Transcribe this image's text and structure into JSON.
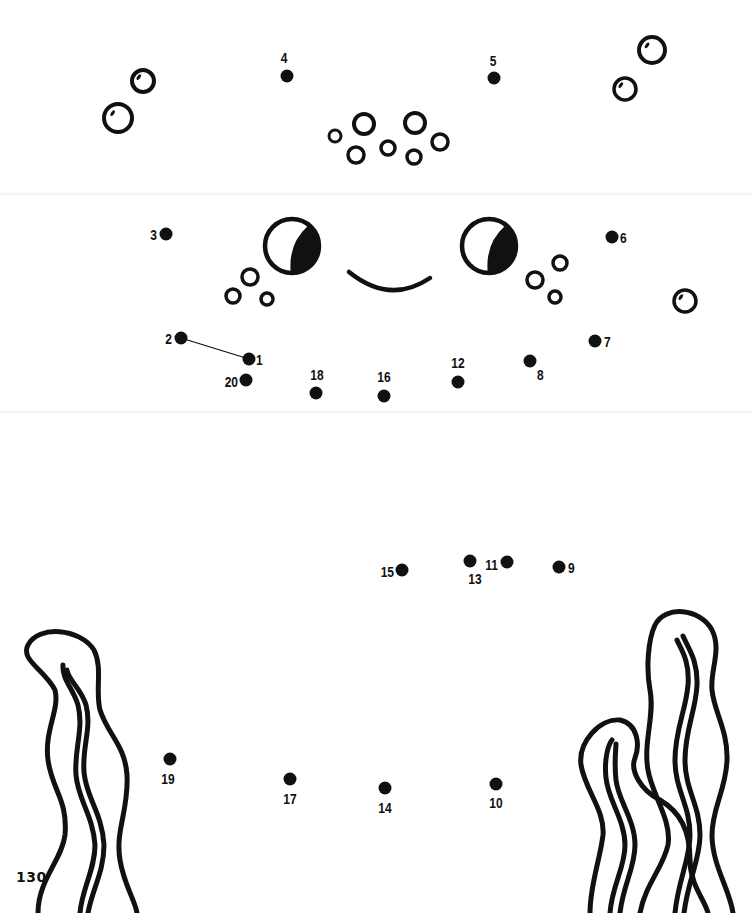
{
  "page": {
    "page_number": "130",
    "background": "#ffffff",
    "ink": "#111111"
  },
  "dots": [
    {
      "n": "1",
      "x": 249,
      "y": 359,
      "lx": 256,
      "ly": 365,
      "anchor": "start"
    },
    {
      "n": "2",
      "x": 181,
      "y": 338,
      "lx": 172,
      "ly": 344,
      "anchor": "end"
    },
    {
      "n": "3",
      "x": 166,
      "y": 234,
      "lx": 157,
      "ly": 240,
      "anchor": "end"
    },
    {
      "n": "4",
      "x": 287,
      "y": 76,
      "lx": 284,
      "ly": 63,
      "anchor": "middle"
    },
    {
      "n": "5",
      "x": 494,
      "y": 78,
      "lx": 493,
      "ly": 66,
      "anchor": "middle"
    },
    {
      "n": "6",
      "x": 612,
      "y": 237,
      "lx": 620,
      "ly": 243,
      "anchor": "start"
    },
    {
      "n": "7",
      "x": 595,
      "y": 341,
      "lx": 604,
      "ly": 347,
      "anchor": "start"
    },
    {
      "n": "8",
      "x": 530,
      "y": 361,
      "lx": 537,
      "ly": 380,
      "anchor": "start"
    },
    {
      "n": "9",
      "x": 559,
      "y": 567,
      "lx": 568,
      "ly": 573,
      "anchor": "start"
    },
    {
      "n": "10",
      "x": 496,
      "y": 784,
      "lx": 496,
      "ly": 808,
      "anchor": "middle"
    },
    {
      "n": "11",
      "x": 507,
      "y": 562,
      "lx": 498,
      "ly": 570,
      "anchor": "end"
    },
    {
      "n": "12",
      "x": 458,
      "y": 382,
      "lx": 458,
      "ly": 368,
      "anchor": "middle"
    },
    {
      "n": "13",
      "x": 470,
      "y": 561,
      "lx": 475,
      "ly": 584,
      "anchor": "middle"
    },
    {
      "n": "14",
      "x": 385,
      "y": 788,
      "lx": 385,
      "ly": 813,
      "anchor": "middle"
    },
    {
      "n": "15",
      "x": 402,
      "y": 570,
      "lx": 394,
      "ly": 577,
      "anchor": "end"
    },
    {
      "n": "16",
      "x": 384,
      "y": 396,
      "lx": 384,
      "ly": 382,
      "anchor": "middle"
    },
    {
      "n": "17",
      "x": 290,
      "y": 779,
      "lx": 290,
      "ly": 804,
      "anchor": "middle"
    },
    {
      "n": "18",
      "x": 316,
      "y": 393,
      "lx": 317,
      "ly": 380,
      "anchor": "middle"
    },
    {
      "n": "19",
      "x": 170,
      "y": 759,
      "lx": 168,
      "ly": 784,
      "anchor": "middle"
    },
    {
      "n": "20",
      "x": 246,
      "y": 380,
      "lx": 238,
      "ly": 387,
      "anchor": "end"
    }
  ],
  "connector_lines": [
    {
      "from": "2",
      "to": "1"
    }
  ],
  "bubbles": [
    {
      "cx": 118,
      "cy": 118,
      "r": 14,
      "w": 4,
      "shine": true
    },
    {
      "cx": 143,
      "cy": 81,
      "r": 11,
      "w": 4,
      "shine": true
    },
    {
      "cx": 652,
      "cy": 50,
      "r": 13,
      "w": 4,
      "shine": true
    },
    {
      "cx": 625,
      "cy": 89,
      "r": 11,
      "w": 3.5,
      "shine": true
    },
    {
      "cx": 685,
      "cy": 301,
      "r": 11,
      "w": 3.5,
      "shine": true
    },
    {
      "cx": 335,
      "cy": 136,
      "r": 6,
      "w": 3,
      "shine": false
    },
    {
      "cx": 364,
      "cy": 124,
      "r": 10,
      "w": 4,
      "shine": false
    },
    {
      "cx": 356,
      "cy": 155,
      "r": 8,
      "w": 3.5,
      "shine": false
    },
    {
      "cx": 388,
      "cy": 148,
      "r": 7,
      "w": 3.5,
      "shine": false
    },
    {
      "cx": 415,
      "cy": 123,
      "r": 10,
      "w": 4,
      "shine": false
    },
    {
      "cx": 414,
      "cy": 157,
      "r": 7,
      "w": 3.5,
      "shine": false
    },
    {
      "cx": 440,
      "cy": 142,
      "r": 8,
      "w": 3.5,
      "shine": false
    },
    {
      "cx": 250,
      "cy": 277,
      "r": 8,
      "w": 3.5,
      "shine": false
    },
    {
      "cx": 233,
      "cy": 296,
      "r": 7,
      "w": 3.5,
      "shine": false
    },
    {
      "cx": 267,
      "cy": 299,
      "r": 6,
      "w": 3.5,
      "shine": false
    },
    {
      "cx": 535,
      "cy": 280,
      "r": 8,
      "w": 3.5,
      "shine": false
    },
    {
      "cx": 560,
      "cy": 263,
      "r": 7,
      "w": 3.5,
      "shine": false
    },
    {
      "cx": 555,
      "cy": 297,
      "r": 6,
      "w": 3.5,
      "shine": false
    }
  ],
  "eyes": [
    {
      "cx": 292,
      "cy": 246,
      "r": 27
    },
    {
      "cx": 489,
      "cy": 246,
      "r": 27
    }
  ],
  "smile": {
    "d": "M 349 272 Q 390 305 430 278"
  },
  "seaweed": {
    "left": {
      "outer": "M 38 913 C 38 880 62 860 65 835 C 68 800 52 790 48 760 C 44 730 60 710 55 690 C 45 670 20 660 28 645 C 38 625 80 628 94 650 C 103 668 95 690 100 710 C 108 735 125 745 127 775 C 129 810 115 830 120 860 C 124 885 135 900 137 913",
      "inner1": "M 80 913 C 82 888 95 870 95 845 C 93 815 78 800 76 775 C 74 748 84 730 78 705 C 73 688 62 680 63 665",
      "inner2": "M 88 913 C 92 890 104 872 104 845 C 102 812 86 798 84 772 C 82 746 92 728 86 705 C 81 688 68 680 67 670"
    },
    "right": {
      "outer1": "M 590 913 C 590 885 600 860 603 835 C 605 810 585 790 581 765 C 578 742 600 718 620 720 C 638 724 640 745 635 758 C 630 770 640 790 660 800 C 680 812 690 830 690 860 C 690 885 705 900 708 913",
      "outer2": "M 640 913 C 645 885 663 868 668 845 C 672 820 652 795 648 770 C 643 742 655 715 650 690 C 646 668 648 640 655 625 C 665 605 700 608 712 630 C 722 650 710 670 712 690 C 714 712 728 730 727 760 C 726 790 712 808 712 835 C 712 865 730 890 733 913",
      "inner_a": "M 610 913 C 612 885 625 868 625 845 C 625 820 608 800 606 778 C 604 760 608 745 612 740",
      "inner_b": "M 620 913 C 623 885 635 868 635 845 C 635 820 618 800 616 780 C 614 762 616 748 616 744",
      "inner_c": "M 675 913 C 678 880 690 860 690 835 C 690 805 675 790 675 760 C 675 730 686 710 688 685 C 690 660 680 648 677 640",
      "inner_d": "M 684 913 C 688 880 700 860 700 835 C 700 805 685 790 685 760 C 685 730 696 710 697 685 C 698 660 688 648 683 636"
    }
  }
}
